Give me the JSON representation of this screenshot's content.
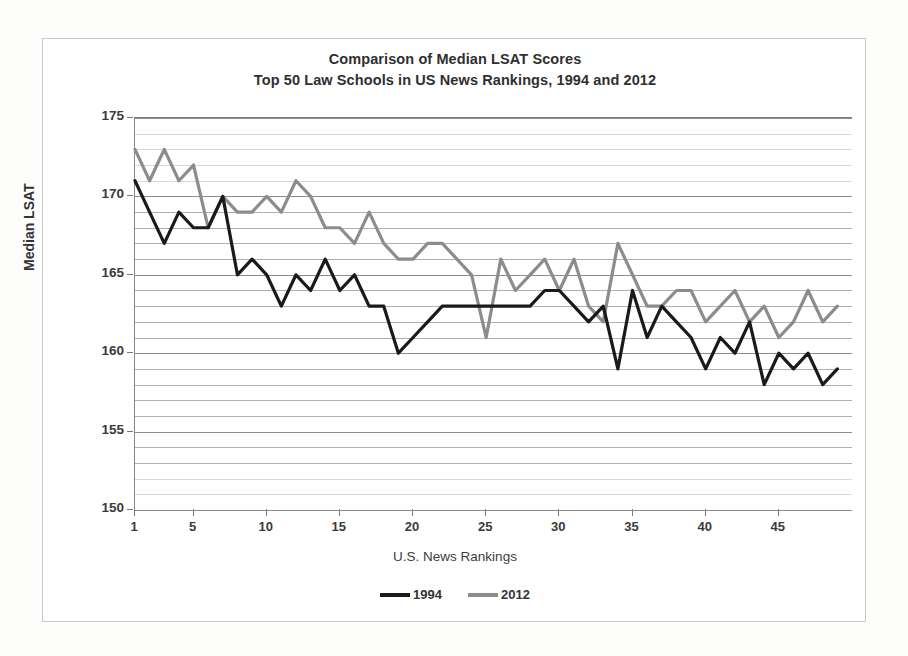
{
  "figure": {
    "title_line1": "Comparison of Median LSAT Scores",
    "title_line2": "Top 50 Law Schools in US News Rankings, 1994 and 2012"
  },
  "chart_data": {
    "type": "line",
    "title": "Comparison of Median LSAT Scores\nTop 50 Law Schools in US News Rankings, 1994 and 2012",
    "xlabel": "U.S. News Rankings",
    "ylabel": "Median LSAT",
    "xlim": [
      1,
      50
    ],
    "ylim": [
      150,
      175
    ],
    "grid": true,
    "grid_minor_step": 1,
    "legend_position": "bottom",
    "x_ticks": [
      1,
      5,
      10,
      15,
      20,
      25,
      30,
      35,
      40,
      45
    ],
    "y_ticks": [
      150,
      155,
      160,
      165,
      170,
      175
    ],
    "x": [
      1,
      2,
      3,
      4,
      5,
      6,
      7,
      8,
      9,
      10,
      11,
      12,
      13,
      14,
      15,
      16,
      17,
      18,
      19,
      20,
      21,
      22,
      23,
      24,
      25,
      26,
      27,
      28,
      29,
      30,
      31,
      32,
      33,
      34,
      35,
      36,
      37,
      38,
      39,
      40,
      41,
      42,
      43,
      44,
      45,
      46,
      47,
      48,
      49
    ],
    "series": [
      {
        "name": "1994",
        "color": "#1a1a1a",
        "values": [
          171,
          169,
          167,
          169,
          168,
          168,
          170,
          165,
          166,
          165,
          163,
          165,
          164,
          166,
          164,
          165,
          163,
          163,
          160,
          161,
          162,
          163,
          163,
          163,
          163,
          163,
          163,
          163,
          164,
          164,
          163,
          162,
          163,
          159,
          164,
          161,
          163,
          162,
          161,
          159,
          161,
          160,
          162,
          158,
          160,
          159,
          160,
          158,
          159
        ]
      },
      {
        "name": "2012",
        "color": "#8c8c8c",
        "values": [
          173,
          171,
          173,
          171,
          172,
          168,
          170,
          169,
          169,
          170,
          169,
          171,
          170,
          168,
          168,
          167,
          169,
          167,
          166,
          166,
          167,
          167,
          166,
          165,
          161,
          166,
          164,
          165,
          166,
          164,
          166,
          163,
          162,
          167,
          165,
          163,
          163,
          164,
          164,
          162,
          163,
          164,
          162,
          163,
          161,
          162,
          164,
          162,
          163
        ]
      }
    ]
  },
  "axes": {
    "y_title": "Median LSAT",
    "x_title": "U.S. News Rankings",
    "y_tick_labels": [
      "175",
      "170",
      "165",
      "160",
      "155",
      "150"
    ],
    "x_tick_labels": [
      "1",
      "5",
      "10",
      "15",
      "20",
      "25",
      "30",
      "35",
      "40",
      "45"
    ]
  },
  "legend": {
    "entries": [
      {
        "label": "1994",
        "color": "#1a1a1a"
      },
      {
        "label": "2012",
        "color": "#8c8c8c"
      }
    ]
  }
}
